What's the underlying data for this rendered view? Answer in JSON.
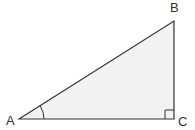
{
  "diagram": {
    "type": "right-triangle",
    "vertices": [
      {
        "name": "A",
        "x": 19,
        "y": 119,
        "label_x": 7,
        "label_y": 125
      },
      {
        "name": "B",
        "x": 174,
        "y": 21,
        "label_x": 170,
        "label_y": 12
      },
      {
        "name": "C",
        "x": 174,
        "y": 119,
        "label_x": 178,
        "label_y": 126
      }
    ],
    "labels": {
      "a": "A",
      "b": "B",
      "c": "C"
    },
    "right_angle_at": "C",
    "marked_angle_at": "A",
    "colors": {
      "stroke": "#333333",
      "fill": "#f2f2f2",
      "label": "#333333"
    }
  }
}
